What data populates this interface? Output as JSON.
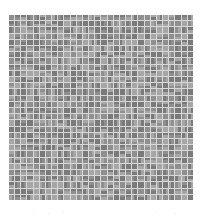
{
  "image": {
    "kind": "gray-mosaic-grid",
    "grid": {
      "cols": 30,
      "rows": 30
    },
    "colors": {
      "line": "#d8d8d8",
      "dark": "#7a7a7a",
      "mid": "#8f8f8f",
      "light": "#a6a6a6",
      "background": "#ffffff"
    },
    "specks": [
      {
        "x": 33,
        "y": 212
      },
      {
        "x": 48,
        "y": 213
      },
      {
        "x": 63,
        "y": 212
      },
      {
        "x": 156,
        "y": 212
      },
      {
        "x": 175,
        "y": 213
      }
    ]
  }
}
